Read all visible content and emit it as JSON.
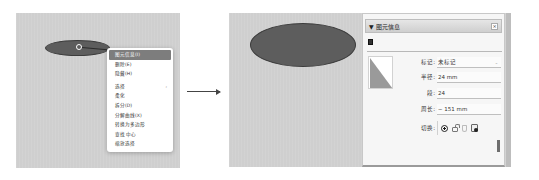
{
  "left_view": {
    "context_menu": {
      "items": [
        {
          "label": "图元信息(I)",
          "active": true
        },
        {
          "label": "删除(E)"
        },
        {
          "label": "隐藏(H)"
        },
        {
          "label": "选择",
          "submenu_arrow": "›"
        },
        {
          "label": "柔化"
        },
        {
          "label": "拆分(D)"
        },
        {
          "label": "分解曲线(X)"
        },
        {
          "label": "转换为多边形"
        },
        {
          "label": "查找 中心"
        },
        {
          "label": "缩放选择"
        }
      ]
    }
  },
  "arrow": {
    "icon": "right-arrow-icon"
  },
  "entity_info_panel": {
    "title": "▼ 图元信息",
    "close_label": "×",
    "entity_type_icon": "circle-entity-icon",
    "fields": {
      "tag": {
        "label": "标记:",
        "value": "未标记",
        "chevron": "⌄"
      },
      "radius": {
        "label": "半径:",
        "value": "24 mm"
      },
      "segments": {
        "label": "段:",
        "value": "24"
      },
      "circumference": {
        "label": "周长:",
        "value": "~ 151 mm"
      },
      "toggles": {
        "label": "切换:",
        "icons": [
          "visible-eye-icon",
          "lock-icon",
          "receive-shadows-icon",
          "cast-shadows-icon"
        ]
      }
    }
  },
  "colors": {
    "canvas": "#cfcfcf",
    "shape_fill": "#5d5d5d",
    "menu_highlight": "#7d7d7d",
    "panel_bg": "#f6f6f6"
  }
}
